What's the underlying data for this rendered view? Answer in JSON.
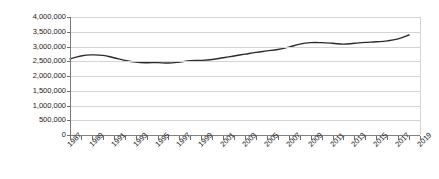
{
  "chart_data": {
    "type": "line",
    "title": "",
    "xlabel": "",
    "ylabel": "",
    "ylim": [
      0,
      4000000
    ],
    "xlim": [
      1987,
      2019
    ],
    "grid": true,
    "legend": false,
    "y_ticks": [
      4000000,
      3500000,
      3000000,
      2500000,
      2000000,
      1500000,
      1000000,
      500000,
      0
    ],
    "y_tick_labels": [
      "4,000,000",
      "3,500,000",
      "3,000,000",
      "2,500,000",
      "2,000,000",
      "1,500,000",
      "1,000,000",
      "500,000",
      "0"
    ],
    "x_tick_labels": [
      "1987",
      "1989",
      "1991",
      "1993",
      "1995",
      "1997",
      "1999",
      "2001",
      "2003",
      "2005",
      "2007",
      "2009",
      "2011",
      "2013",
      "2015",
      "2017",
      "2019"
    ],
    "x_tick_label_interval": 2,
    "x_minor_tick_interval": 1,
    "series_color": "#2b2b2b",
    "grid_color": "#d4d4d4",
    "axis_color": "#7a7a7a",
    "x": [
      1987,
      1988,
      1989,
      1990,
      1991,
      1992,
      1993,
      1994,
      1995,
      1996,
      1997,
      1998,
      1999,
      2000,
      2001,
      2002,
      2003,
      2004,
      2005,
      2006,
      2007,
      2008,
      2009,
      2010,
      2011,
      2012,
      2013,
      2014,
      2015,
      2016,
      2017,
      2018
    ],
    "values": [
      2580000,
      2680000,
      2715000,
      2700000,
      2620000,
      2530000,
      2470000,
      2450000,
      2455000,
      2440000,
      2470000,
      2520000,
      2530000,
      2560000,
      2620000,
      2680000,
      2740000,
      2800000,
      2850000,
      2900000,
      2980000,
      3080000,
      3130000,
      3130000,
      3110000,
      3080000,
      3110000,
      3140000,
      3160000,
      3190000,
      3260000,
      3390000
    ]
  }
}
